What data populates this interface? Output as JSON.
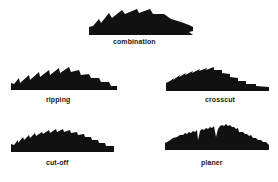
{
  "diagram": {
    "fill_color": "#111111",
    "background": "#ffffff",
    "blades": [
      {
        "id": "combination",
        "label": "combination",
        "box": {
          "x": 89,
          "y": 9,
          "w": 105,
          "h": 27
        },
        "label_pos": {
          "x": 113,
          "y": 38
        },
        "path": "M0,26 L0,18 L4,17 L10,10 L12,14 L20,4 L23,9 L33,1 L36,5 L48,0 L50,4 L61,0 L64,5 L75,5 L82,10 L92,13 L100,16 L104,18 L104,22 L100,23 L104,26 Z"
      },
      {
        "id": "ripping",
        "label": "ripping",
        "box": {
          "x": 11,
          "y": 67,
          "w": 106,
          "h": 24
        },
        "label_pos": {
          "x": 46,
          "y": 96
        },
        "path": "M0,23 L0,16 L3,17 L8,11 L9,16 L18,8 L19,13 L28,5 L29,10 L38,3 L39,8 L48,1 L49,6 L58,0 L60,5 L68,3 L70,8 L78,7 L80,11 L88,11 L90,15 L98,15 L100,19 L106,19 L106,23 Z"
      },
      {
        "id": "crosscut",
        "label": "crosscut",
        "box": {
          "x": 166,
          "y": 67,
          "w": 103,
          "h": 25
        },
        "label_pos": {
          "x": 205,
          "y": 96
        },
        "path": "M0,24 L0,16 L4,14 L8,11 L7,13 L14,8 L13,10 L20,6 L19,8 L27,4 L26,6 L34,2 L33,4 L41,1 L40,3 L48,0 L48,3 L56,3 L56,6 L64,7 L64,10 L72,11 L72,14 L80,14 L80,17 L90,17 L90,19 L103,20 L103,24 Z"
      },
      {
        "id": "cut-off",
        "label": "cut-off",
        "box": {
          "x": 11,
          "y": 129,
          "w": 103,
          "h": 24
        },
        "label_pos": {
          "x": 46,
          "y": 159
        },
        "path": "M0,23 L0,15 L3,16 L7,11 L7,14 L12,8 L13,11 L18,6 L19,9 L24,4 L25,7 L31,3 L32,5 L38,1 L39,4 L45,0 L46,3 L52,0 L53,3 L59,1 L60,4 L66,3 L67,6 L73,5 L74,8 L80,8 L81,11 L87,11 L88,14 L94,14 L95,17 L103,17 L103,23 Z"
      },
      {
        "id": "planer",
        "label": "planer",
        "box": {
          "x": 165,
          "y": 124,
          "w": 104,
          "h": 27
        },
        "label_pos": {
          "x": 201,
          "y": 159
        },
        "path": "M0,26 L0,19 L4,17 L8,14 L12,13 L15,11 L18,11 L20,9 L22,10 L24,8 L26,9 L28,7 L30,8 L32,6 L33,16 L35,7 L37,5 L39,6 L41,4 L43,5 L45,3 L47,4 L49,2 L51,13 L53,5 L55,2 L57,1 L59,2 L61,0 L63,2 L65,1 L67,3 L69,3 L71,5 L73,4 L74,8 L78,8 L80,10 L82,10 L84,12 L86,11 L88,14 L91,14 L93,16 L96,16 L98,18 L101,18 L104,21 L104,26 Z"
      }
    ]
  }
}
